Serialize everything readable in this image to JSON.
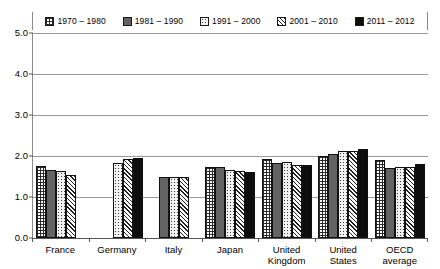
{
  "chart_data": {
    "type": "bar",
    "title": "",
    "xlabel": "",
    "ylabel": "",
    "ylim": [
      0.0,
      5.0
    ],
    "ytick_labels": [
      "0.0",
      "1.0",
      "2.0",
      "3.0",
      "4.0",
      "5.0"
    ],
    "ytick_values": [
      0.0,
      1.0,
      2.0,
      3.0,
      4.0,
      5.0
    ],
    "grid": true,
    "legend_position": "top",
    "categories": [
      "France",
      "Germany",
      "Italy",
      "Japan",
      "United\nKingdom",
      "United\nStates",
      "OECD\naverage"
    ],
    "series": [
      {
        "name": "1970 – 1980",
        "pattern": "grid",
        "values": [
          1.75,
          null,
          null,
          1.73,
          1.92,
          2.01,
          1.9
        ]
      },
      {
        "name": "1981 – 1990",
        "pattern": "solid-gray",
        "values": [
          1.66,
          null,
          1.49,
          1.74,
          1.84,
          2.06,
          1.7
        ]
      },
      {
        "name": "1991 – 2000",
        "pattern": "dots",
        "values": [
          1.64,
          1.83,
          1.5,
          1.66,
          1.85,
          2.12,
          1.72
        ]
      },
      {
        "name": "2001 – 2010",
        "pattern": "diagonal",
        "values": [
          1.53,
          1.93,
          1.5,
          1.64,
          1.78,
          2.13,
          1.74
        ]
      },
      {
        "name": "2011 – 2012",
        "pattern": "black",
        "values": [
          null,
          1.96,
          null,
          1.6,
          1.78,
          2.18,
          1.8
        ]
      }
    ],
    "colors": {
      "gridline": "#9a9a9a",
      "axis": "#555555",
      "bar_outline": "#111111",
      "series_solid_gray": "#636363",
      "series_black": "#0d0d0d"
    }
  }
}
